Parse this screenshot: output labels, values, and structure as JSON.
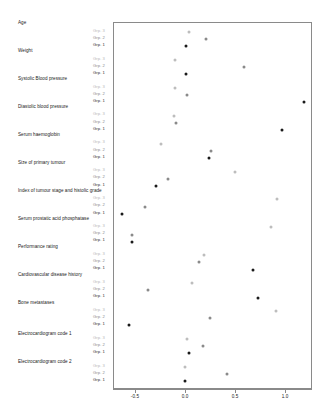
{
  "chart_data": {
    "type": "scatter",
    "title": "",
    "subtitle": "",
    "xlabel": "",
    "ylabel": "",
    "xlim": [
      -0.72,
      1.27
    ],
    "xticks": [
      -0.5,
      0.0,
      0.5,
      1.0
    ],
    "xticklabels": [
      "-0.5",
      "0.0",
      "0.5",
      "1.0"
    ],
    "grid": false,
    "legend_position": "inline-left",
    "group_labels": [
      "Grp. 3",
      "Grp. 2",
      "Grp. 1"
    ],
    "series": [
      {
        "name": "Grp. 3",
        "values": [
          0.03,
          -0.11,
          -0.11,
          -0.12,
          -0.25,
          0.49,
          0.91,
          0.85,
          0.18,
          0.06,
          0.9,
          0.01,
          -0.01
        ]
      },
      {
        "name": "Grp. 2",
        "values": [
          0.2,
          0.58,
          0.01,
          -0.1,
          0.25,
          -0.18,
          -0.41,
          -0.54,
          0.13,
          -0.38,
          0.24,
          0.17,
          0.41
        ]
      },
      {
        "name": "Grp. 1",
        "values": [
          0.0,
          0.0,
          1.18,
          0.96,
          0.23,
          -0.3,
          -0.64,
          -0.54,
          0.67,
          0.72,
          -0.57,
          0.03,
          -0.01
        ]
      }
    ],
    "categories": [
      "Age",
      "Weight",
      "Systolic Blood pressure",
      "Diastolic blood pressure",
      "Serum haemoglobin",
      "Size of primary tumour",
      "Index of tumour stage and histolic grade",
      "Serum prostatic acid phosphatase",
      "Performance rating",
      "Cardiovascular disease history",
      "Bone metastases",
      "Electrocardiogram code 1",
      "Electrocardiogram code 2"
    ],
    "colors": {
      "grp3": "#bdbdbd",
      "grp2": "#8a8a8a",
      "grp1": "#1a1a1a",
      "panel_border": "#8a8a8a",
      "background": "#ffffff"
    }
  }
}
